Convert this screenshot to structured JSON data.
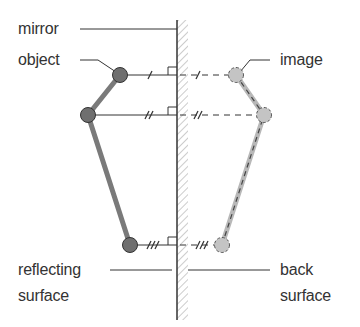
{
  "labels": {
    "mirror": "mirror",
    "object": "object",
    "image": "image",
    "reflecting_line1": "reflecting",
    "reflecting_line2": "surface",
    "back_line1": "back",
    "back_line2": "surface"
  },
  "colors": {
    "object_fill": "#6f6f6f",
    "object_rod": "#7a7a7a",
    "image_fill": "#c4c4c4",
    "line": "#333333",
    "hatch": "#9a9a9a"
  },
  "points": {
    "object": [
      [
        120,
        75
      ],
      [
        88,
        115
      ],
      [
        130,
        245
      ]
    ],
    "image": [
      [
        236,
        75
      ],
      [
        264,
        115
      ],
      [
        222,
        245
      ]
    ],
    "mirror_x": 177
  },
  "tick_marks": [
    "/",
    "//",
    "///"
  ]
}
